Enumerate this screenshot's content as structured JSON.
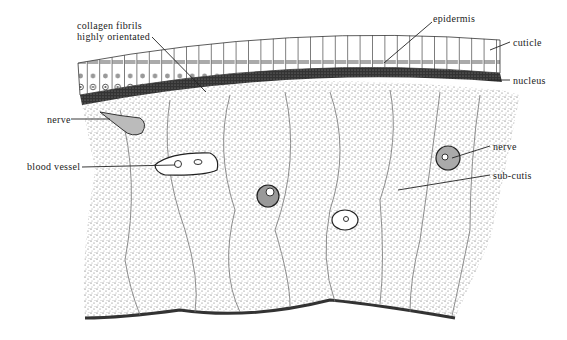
{
  "figure": {
    "type": "histological cross-section illustration",
    "labels": {
      "collagen_1": "collagen fibrils",
      "collagen_2": "highly orientated",
      "epidermis": "epidermis",
      "cuticle": "cuticle",
      "nucleus": "nucleus",
      "nerve_left": "nerve",
      "blood_vessel": "blood vessel",
      "nerve_right": "nerve",
      "sub_cutis": "sub-cutis"
    },
    "colors": {
      "ink": "#222222",
      "background": "#ffffff",
      "stipple": "#555555"
    }
  }
}
